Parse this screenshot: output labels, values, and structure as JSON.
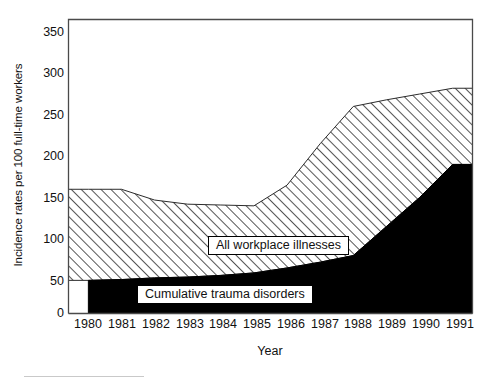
{
  "chart_data": {
    "type": "area",
    "title": "",
    "subtitle": "",
    "xlabel": "Year",
    "ylabel": "Incidence rates per 100 full-time workers",
    "categories": [
      "1980",
      "1981",
      "1982",
      "1983",
      "1984",
      "1985",
      "1986",
      "1987",
      "1988",
      "1989",
      "1990",
      "1991"
    ],
    "x": [
      1980,
      1981,
      1982,
      1983,
      1984,
      1985,
      1986,
      1987,
      1988,
      1989,
      1990,
      1991
    ],
    "xlim": [
      1979.4,
      1991.6
    ],
    "ylim": [
      0,
      355
    ],
    "yticks": [
      0,
      50,
      100,
      150,
      200,
      250,
      300,
      350
    ],
    "ytick_labels": [
      "0",
      "50",
      "100",
      "150",
      "200",
      "250",
      "300",
      "350"
    ],
    "grid": false,
    "legend_position": "inside-plot",
    "stacked": true,
    "series": [
      {
        "name": "Cumulative trauma disorders",
        "fill": "#000000",
        "pattern": "solid-black",
        "values": [
          40,
          41,
          43,
          44,
          46,
          49,
          55,
          62,
          70,
          105,
          140,
          180
        ]
      },
      {
        "name": "All workplace illnesses",
        "fill": "#ffffff",
        "pattern": "diagonal-hatch",
        "values": [
          150,
          150,
          137,
          132,
          131,
          130,
          155,
          205,
          250,
          258,
          265,
          272
        ]
      }
    ],
    "annotations": [
      {
        "name": "all-workplace-illnesses-label",
        "text": "All workplace illnesses"
      },
      {
        "name": "cumulative-trauma-disorders-label",
        "text": "Cumulative trauma disorders"
      }
    ]
  },
  "axis": {
    "y_title": "Incidence rates per 100 full-time workers",
    "x_title": "Year",
    "y_tick_labels": [
      "350",
      "300",
      "250",
      "200",
      "150",
      "100",
      "50",
      "0"
    ],
    "x_tick_labels": [
      "1980",
      "1981",
      "1982",
      "1983",
      "1984",
      "1985",
      "1986",
      "1987",
      "1988",
      "1989",
      "1990",
      "1991"
    ]
  },
  "legend": {
    "upper_label": "All workplace illnesses",
    "lower_label": "Cumulative trauma disorders"
  },
  "colors": {
    "frame": "#4a4a4a",
    "hatch_line": "#2b2b2b",
    "solid_area": "#000000",
    "background": "#ffffff"
  }
}
